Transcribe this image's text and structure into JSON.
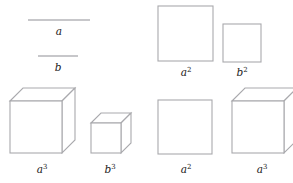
{
  "figure": {
    "stroke_color": "#a9a9ad",
    "rule_color": "#b4b4b8",
    "label_color": "#1a1a1a",
    "background": "#ffffff",
    "panels": [
      {
        "id": "panel-lengths",
        "name": "line-segments-panel",
        "description": "Two horizontal line segments representing lengths a and b",
        "items": [
          {
            "id": "segment-a",
            "shape": "line-segment",
            "label_base": "a",
            "label_exponent": "",
            "label_full": "a",
            "length_px": 62,
            "x1": 28,
            "x2": 90,
            "y": 20,
            "label_x": 59,
            "label_y": 35
          },
          {
            "id": "segment-b",
            "shape": "line-segment",
            "label_base": "b",
            "label_exponent": "",
            "label_full": "b",
            "length_px": 40,
            "x1": 38,
            "x2": 78,
            "y": 56,
            "label_x": 58,
            "label_y": 71
          }
        ]
      },
      {
        "id": "panel-squares",
        "name": "squares-panel",
        "description": "Two squares representing areas a squared and b squared",
        "items": [
          {
            "id": "square-a2",
            "shape": "square",
            "label_base": "a",
            "label_exponent": "2",
            "label_full": "a2",
            "side_px": 55,
            "x": 158,
            "y": 6,
            "w": 55,
            "h": 55,
            "label_x": 186,
            "label_y": 76
          },
          {
            "id": "square-b2",
            "shape": "square",
            "label_base": "b",
            "label_exponent": "2",
            "label_full": "b2",
            "side_px": 38,
            "x": 223,
            "y": 24,
            "w": 38,
            "h": 38,
            "label_x": 242,
            "label_y": 76
          }
        ]
      },
      {
        "id": "panel-cubes",
        "name": "cubes-panel",
        "description": "Two cubes representing volumes a cubed and b cubed",
        "items": [
          {
            "id": "cube-a3",
            "shape": "cube",
            "label_base": "a",
            "label_exponent": "3",
            "label_full": "a3",
            "side_px": 52,
            "x": 10,
            "y": 101,
            "w": 52,
            "h": 52,
            "depth": 13,
            "label_x": 42,
            "label_y": 173
          },
          {
            "id": "cube-b3",
            "shape": "cube",
            "label_base": "b",
            "label_exponent": "3",
            "label_full": "b3",
            "side_px": 30,
            "x": 91,
            "y": 123,
            "w": 30,
            "h": 30,
            "depth": 10,
            "label_x": 110,
            "label_y": 173
          }
        ]
      },
      {
        "id": "panel-compare",
        "name": "square-vs-cube-panel",
        "description": "A square of area a squared next to a cube of volume a cubed",
        "items": [
          {
            "id": "square-a2-compare",
            "shape": "square",
            "label_base": "a",
            "label_exponent": "2",
            "label_full": "a2",
            "side_px": 54,
            "x": 158,
            "y": 100,
            "w": 54,
            "h": 54,
            "label_x": 186,
            "label_y": 173
          },
          {
            "id": "cube-a3-compare",
            "shape": "cube",
            "label_base": "a",
            "label_exponent": "3",
            "label_full": "a3",
            "side_px": 52,
            "x": 232,
            "y": 101,
            "w": 52,
            "h": 52,
            "depth": 13,
            "label_x": 262,
            "label_y": 173
          }
        ]
      }
    ]
  }
}
